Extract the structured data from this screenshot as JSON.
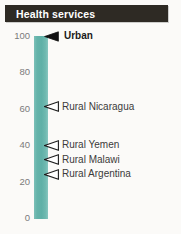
{
  "header": {
    "title": "Health services",
    "bg_color": "#2e2a24",
    "text_color": "#ffffff"
  },
  "chart_data": {
    "type": "bar",
    "title": "Health services",
    "xlabel": "",
    "ylabel": "",
    "ylim": [
      0,
      100
    ],
    "grid": false,
    "legend": "none",
    "orientation": "vertical",
    "bar_color": "#66b5ac",
    "categories": [
      "Health services"
    ],
    "values": [
      100
    ],
    "y_ticks": [
      {
        "value": 100,
        "label": "100"
      },
      {
        "value": 80,
        "label": "80"
      },
      {
        "value": 60,
        "label": "60"
      },
      {
        "value": 40,
        "label": "40"
      },
      {
        "value": 20,
        "label": "20"
      },
      {
        "value": 0,
        "label": "0"
      }
    ],
    "annotations": [
      {
        "label": "Urban",
        "value": 100,
        "marker": "filled-left-triangle",
        "emphasis": true
      },
      {
        "label": "Rural Nicaragua",
        "value": 61,
        "marker": "hollow-left-triangle",
        "emphasis": false
      },
      {
        "label": "Rural Yemen",
        "value": 40,
        "marker": "hollow-left-triangle",
        "emphasis": false
      },
      {
        "label": "Rural Malawi",
        "value": 32,
        "marker": "hollow-left-triangle",
        "emphasis": false
      },
      {
        "label": "Rural Argentina",
        "value": 24,
        "marker": "hollow-left-triangle",
        "emphasis": false
      }
    ]
  }
}
